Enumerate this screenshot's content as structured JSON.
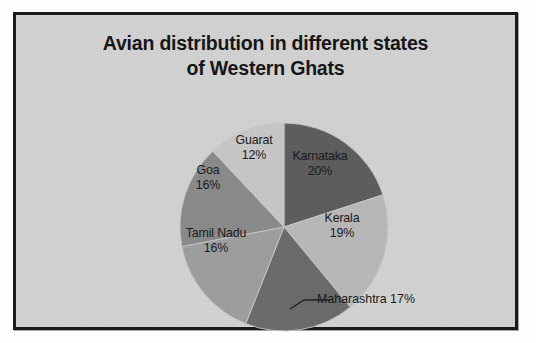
{
  "chart_data": {
    "type": "pie",
    "title": "Avian distribution in different states of Western Ghats",
    "title_line1": "Avian distribution in different states",
    "title_line2": "of Western Ghats",
    "categories": [
      "Karnataka",
      "Kerala",
      "Maharashtra",
      "Tamil Nadu",
      "Goa",
      "Guarat"
    ],
    "values": [
      20,
      19,
      17,
      16,
      16,
      12
    ],
    "unit": "%",
    "start_angle_deg": 0,
    "direction": "clockwise",
    "legend": "none",
    "labels_position": "inside-slices, Maharashtra outside with leader line",
    "slice_colors": [
      "#5c5c5c",
      "#b9b9b9",
      "#6a6a6a",
      "#9e9e9e",
      "#8a8a8a",
      "#c8c8c8"
    ],
    "slices": [
      {
        "name": "Karnataka",
        "value": 20,
        "label": "Karnataka",
        "pct_label": "20%",
        "color": "#5c5c5c",
        "placement": "inside"
      },
      {
        "name": "Kerala",
        "value": 19,
        "label": "Kerala",
        "pct_label": "19%",
        "color": "#b9b9b9",
        "placement": "inside"
      },
      {
        "name": "Maharashtra",
        "value": 17,
        "label": "Maharashtra",
        "pct_label": "17%",
        "color": "#6a6a6a",
        "placement": "outside"
      },
      {
        "name": "Tamil Nadu",
        "value": 16,
        "label": "Tamil Nadu",
        "pct_label": "16%",
        "color": "#9e9e9e",
        "placement": "inside"
      },
      {
        "name": "Goa",
        "value": 16,
        "label": "Goa",
        "pct_label": "16%",
        "color": "#8a8a8a",
        "placement": "inside"
      },
      {
        "name": "Guarat",
        "value": 12,
        "label": "Guarat",
        "pct_label": "12%",
        "color": "#c8c8c8",
        "placement": "inside"
      }
    ]
  },
  "figure": {
    "background_color": "#d3d3d3",
    "border_color": "#1b1b1b",
    "page_color": "#fdfdfd",
    "text_color": "#17181a"
  }
}
